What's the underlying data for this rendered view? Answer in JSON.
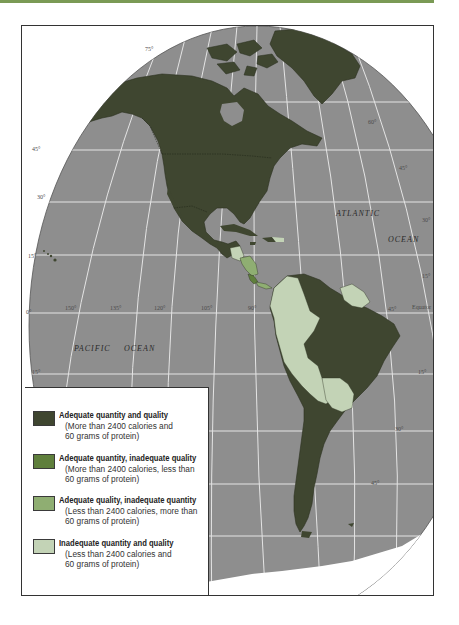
{
  "map": {
    "title": "Food consumption adequacy in the Americas",
    "oceans": {
      "atlantic_1": "ATLANTIC",
      "atlantic_2": "OCEAN",
      "pacific_1": "PACIFIC",
      "pacific_2": "OCEAN"
    },
    "equator_label": "Equator",
    "latitude_labels_left": [
      "75°",
      "45°",
      "30°",
      "15°",
      "0°",
      "15°"
    ],
    "latitude_labels_right": [
      "60°",
      "45°",
      "30°",
      "15°",
      "15°",
      "30°",
      "45°"
    ],
    "longitude_labels": [
      "150°",
      "135°",
      "120°",
      "105°",
      "90°",
      "45°"
    ],
    "colors": {
      "ocean": "#8e8e8e",
      "graticule": "#e8e8e8",
      "adequate_both": "#3f4630",
      "adequate_quantity_only": "#5f7f3c",
      "adequate_quality_only": "#8fae72",
      "inadequate_both": "#c3d3b6",
      "ice": "#ffffff",
      "accent_bar": "#7a9a55"
    }
  },
  "legend": {
    "items": [
      {
        "title": "Adequate quantity and quality",
        "line1": "(More than 2400 calories and",
        "line2": "60 grams of protein)",
        "color": "#3f4630"
      },
      {
        "title": "Adequate quantity, inadequate quality",
        "line1": "(More than 2400 calories, less than",
        "line2": " 60 grams of protein)",
        "color": "#5f7f3c"
      },
      {
        "title": "Adequate quality, inadequate quantity",
        "line1": "(Less than 2400 calories, more than",
        "line2": "60 grams of protein)",
        "color": "#8fae72"
      },
      {
        "title": "Inadequate quantity and quality",
        "line1": "(Less than 2400 calories and",
        "line2": "60 grams of protein)",
        "color": "#c3d3b6"
      }
    ]
  }
}
